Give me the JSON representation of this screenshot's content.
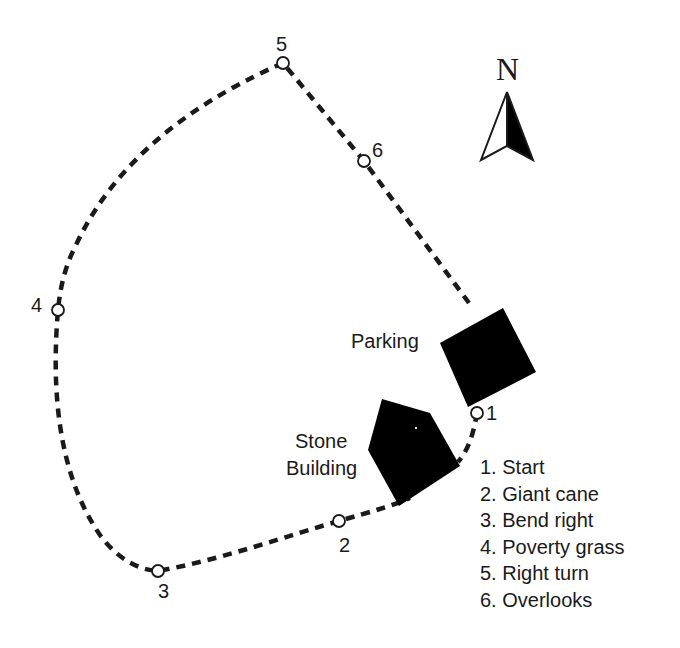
{
  "map": {
    "compass": {
      "label": "N",
      "icon": "north-arrow-icon"
    },
    "places": {
      "parking": {
        "label": "Parking",
        "color": "#000000"
      },
      "stone_building": {
        "label_line1": "Stone",
        "label_line2": "Building",
        "color": "#000000"
      }
    },
    "waypoints": [
      {
        "number": "1",
        "name": "Start"
      },
      {
        "number": "2",
        "name": "Giant cane"
      },
      {
        "number": "3",
        "name": "Bend right"
      },
      {
        "number": "4",
        "name": "Poverty grass"
      },
      {
        "number": "5",
        "name": "Right turn"
      },
      {
        "number": "6",
        "name": "Overlooks"
      }
    ],
    "legend": [
      "1. Start",
      "2. Giant cane",
      "3. Bend right",
      "4. Poverty grass",
      "5. Right turn",
      "6. Overlooks"
    ],
    "colors": {
      "ink": "#1a1a1a",
      "background": "#ffffff"
    }
  }
}
